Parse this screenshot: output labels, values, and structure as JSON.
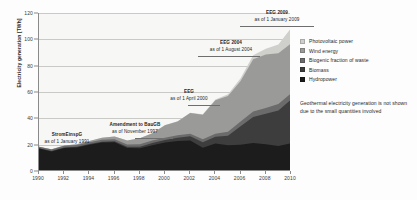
{
  "chart_data": {
    "type": "area",
    "title": "",
    "subtitle": "",
    "xlabel": "",
    "ylabel": "Electricity generation [TWh]",
    "xlim": [
      1990,
      2010
    ],
    "ylim": [
      0,
      120
    ],
    "grid": true,
    "legend_position": "right",
    "stacked": true,
    "x": [
      1990,
      1991,
      1992,
      1993,
      1994,
      1995,
      1996,
      1997,
      1998,
      1999,
      2000,
      2001,
      2002,
      2003,
      2004,
      2005,
      2006,
      2007,
      2008,
      2009,
      2010
    ],
    "xticks": [
      "1990",
      "1992",
      "1994",
      "1996",
      "1998",
      "2000",
      "2002",
      "2004",
      "2006",
      "2008",
      "2010"
    ],
    "yticks": [
      "0",
      "20",
      "40",
      "60",
      "80",
      "100",
      "120"
    ],
    "series": [
      {
        "name": "Hydropower",
        "color": "#1c1c1c",
        "values": [
          17.0,
          14.9,
          17.4,
          17.9,
          19.9,
          21.6,
          21.8,
          17.4,
          17.2,
          19.6,
          21.7,
          22.7,
          23.1,
          17.7,
          20.9,
          19.6,
          20.0,
          21.2,
          20.4,
          19.0,
          21.0
        ]
      },
      {
        "name": "Biomass",
        "color": "#3d3d3d",
        "values": [
          0.2,
          0.3,
          0.4,
          0.5,
          0.6,
          0.7,
          0.8,
          1.0,
          1.3,
          1.6,
          1.8,
          2.5,
          3.2,
          4.2,
          5.2,
          7.2,
          14.0,
          19.8,
          23.0,
          27.0,
          33.3
        ]
      },
      {
        "name": "Biogenic fraction of waste",
        "color": "#6b6b6b",
        "values": [
          1.2,
          1.2,
          1.3,
          1.3,
          1.4,
          1.5,
          1.6,
          1.8,
          1.9,
          1.9,
          1.8,
          1.9,
          2.0,
          2.2,
          2.1,
          3.0,
          3.6,
          4.2,
          4.5,
          4.8,
          4.7
        ]
      },
      {
        "name": "Wind energy",
        "color": "#9a9a98",
        "values": [
          0.1,
          0.2,
          0.3,
          0.6,
          0.9,
          1.5,
          2.0,
          3.0,
          4.5,
          5.5,
          9.5,
          10.5,
          15.8,
          18.7,
          25.5,
          27.2,
          30.7,
          39.7,
          40.6,
          38.6,
          37.8
        ]
      },
      {
        "name": "Photovoltaic power",
        "color": "#cfcfcc",
        "values": [
          0.0,
          0.0,
          0.0,
          0.0,
          0.0,
          0.0,
          0.0,
          0.0,
          0.0,
          0.0,
          0.1,
          0.1,
          0.2,
          0.3,
          0.6,
          1.3,
          2.2,
          3.1,
          4.4,
          6.6,
          11.7
        ]
      }
    ],
    "annotations": [
      {
        "line1": "StromEinspG",
        "line2": "as of 1 January 1991"
      },
      {
        "line1": "Amendment to BauGB",
        "line2": "as of November 1997"
      },
      {
        "line1": "EEG",
        "line2": "as of 1 April 2000"
      },
      {
        "line1": "EEG 2004",
        "line2": "as of 1 August 2004"
      },
      {
        "line1": "EEG 2009",
        "line2": "as of 1 January 2009"
      }
    ],
    "footnote": "Geothermal electricity generation is not shown due to the small quantities involved"
  },
  "legend": {
    "items": [
      {
        "label": "Photovoltaic power",
        "color": "#cfcfcc"
      },
      {
        "label": "Wind energy",
        "color": "#9a9a98"
      },
      {
        "label": "Biogenic fraction of waste",
        "color": "#6b6b6b"
      },
      {
        "label": "Biomass",
        "color": "#3d3d3d"
      },
      {
        "label": "Hydropower",
        "color": "#1c1c1c"
      }
    ]
  }
}
